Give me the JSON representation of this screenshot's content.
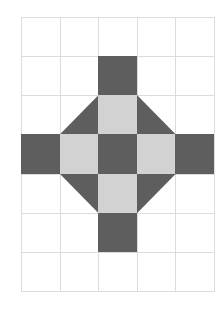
{
  "diagram": {
    "type": "grid-pattern",
    "columns": 5,
    "rows": 7,
    "colors": {
      "dark": "#5e5e5e",
      "light": "#d2d2d2",
      "gridline": "#dcdcdc",
      "background": "#ffffff"
    },
    "filled_cells": [
      {
        "row": 1,
        "col": 2,
        "fill": "dark",
        "shape": "square"
      },
      {
        "row": 2,
        "col": 1,
        "fill": "dark",
        "shape": "triangle-bottom-right"
      },
      {
        "row": 2,
        "col": 2,
        "fill": "light",
        "shape": "square"
      },
      {
        "row": 2,
        "col": 3,
        "fill": "dark",
        "shape": "triangle-bottom-left"
      },
      {
        "row": 3,
        "col": 0,
        "fill": "dark",
        "shape": "square"
      },
      {
        "row": 3,
        "col": 1,
        "fill": "light",
        "shape": "square"
      },
      {
        "row": 3,
        "col": 2,
        "fill": "dark",
        "shape": "square"
      },
      {
        "row": 3,
        "col": 3,
        "fill": "light",
        "shape": "square"
      },
      {
        "row": 3,
        "col": 4,
        "fill": "dark",
        "shape": "square"
      },
      {
        "row": 4,
        "col": 1,
        "fill": "dark",
        "shape": "triangle-top-right"
      },
      {
        "row": 4,
        "col": 2,
        "fill": "light",
        "shape": "square"
      },
      {
        "row": 4,
        "col": 3,
        "fill": "dark",
        "shape": "triangle-top-left"
      },
      {
        "row": 5,
        "col": 2,
        "fill": "dark",
        "shape": "square"
      }
    ]
  }
}
